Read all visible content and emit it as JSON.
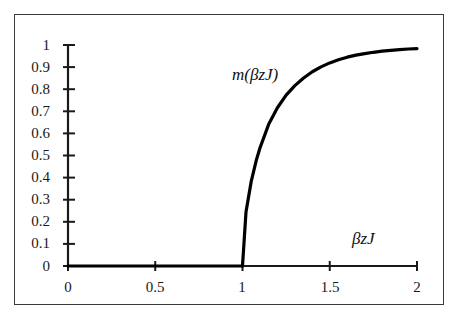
{
  "figure": {
    "background_color": "#ffffff",
    "frame_color": "#3a3a3a",
    "curve_color": "#000000",
    "axis_color": "#1a1a1a"
  },
  "axes": {
    "x": {
      "label": "βzJ",
      "ticks": [
        "0",
        "0.5",
        "1",
        "1.5",
        "2"
      ],
      "tick_values": [
        0,
        0.5,
        1,
        1.5,
        2
      ],
      "range": [
        0,
        2
      ]
    },
    "y": {
      "label": "",
      "ticks": [
        "0",
        "0.1",
        "0.2",
        "0.3",
        "0.4",
        "0.5",
        "0.6",
        "0.7",
        "0.8",
        "0.9",
        "1"
      ],
      "tick_values": [
        0,
        0.1,
        0.2,
        0.3,
        0.4,
        0.5,
        0.6,
        0.7,
        0.8,
        0.9,
        1
      ],
      "range": [
        0,
        1
      ]
    }
  },
  "annotations": {
    "curve_label": "m(βzJ)"
  },
  "chart_data": {
    "type": "line",
    "title": "",
    "subtitle": "",
    "xlabel": "βzJ",
    "ylabel": "",
    "xlim": [
      0,
      2
    ],
    "ylim": [
      0,
      1
    ],
    "grid": false,
    "legend": "none",
    "annotations": [
      {
        "text": "m(βzJ)",
        "x": 1.25,
        "y": 0.86
      },
      {
        "text": "βzJ",
        "x": 1.7,
        "y": 0.1
      }
    ],
    "series": [
      {
        "name": "m(βzJ)",
        "color": "#000000",
        "linewidth": 3.2,
        "x": [
          0,
          0.1,
          0.2,
          0.3,
          0.4,
          0.5,
          0.6,
          0.7,
          0.8,
          0.9,
          0.95,
          1.0
        ],
        "values": [
          0,
          0,
          0,
          0,
          0,
          0,
          0,
          0,
          0,
          0,
          0,
          0
        ]
      },
      {
        "name": "m(βzJ) ordered branch",
        "color": "#000000",
        "linewidth": 3.2,
        "x": [
          1.0,
          1.02,
          1.05,
          1.08,
          1.1,
          1.15,
          1.2,
          1.25,
          1.3,
          1.35,
          1.4,
          1.45,
          1.5,
          1.55,
          1.6,
          1.65,
          1.7,
          1.75,
          1.8,
          1.85,
          1.9,
          1.95,
          2.0
        ],
        "values": [
          0.0,
          0.244,
          0.383,
          0.481,
          0.534,
          0.641,
          0.716,
          0.773,
          0.816,
          0.851,
          0.879,
          0.901,
          0.919,
          0.933,
          0.945,
          0.954,
          0.961,
          0.967,
          0.972,
          0.976,
          0.979,
          0.982,
          0.984
        ]
      }
    ]
  }
}
